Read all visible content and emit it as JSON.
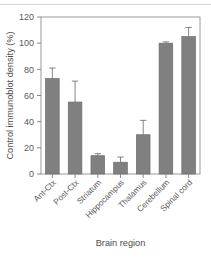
{
  "figure": {
    "background_color": "#ffffff",
    "top_rule_color": "#d8d8d8"
  },
  "chart_data": {
    "type": "bar",
    "title": "",
    "xlabel": "Brain region",
    "ylabel": "Control immunoblot density (%)",
    "categories": [
      "Ant-Ctx",
      "Post-Ctx",
      "Striatum",
      "Hippocampus",
      "Thalamus",
      "Cerebellum",
      "Spinal cord"
    ],
    "values": [
      73,
      55,
      14,
      9,
      30,
      100,
      105
    ],
    "errors": [
      8,
      16,
      1.5,
      4,
      11,
      1,
      7
    ],
    "error_type": "upper",
    "ylim": [
      0,
      120
    ],
    "yticks": [
      0,
      20,
      40,
      60,
      80,
      100,
      120
    ],
    "ytick_labels": [
      "0",
      "20",
      "40",
      "60",
      "80",
      "100",
      "120"
    ],
    "grid": false,
    "legend": null,
    "bar_color": "#808080",
    "bar_edge_color": "#6b6b6b",
    "error_bar_color": "#777777",
    "axis_color": "#9a9a9a",
    "tick_label_color": "#5a5a5a",
    "xtick_label_rotation": 45
  }
}
